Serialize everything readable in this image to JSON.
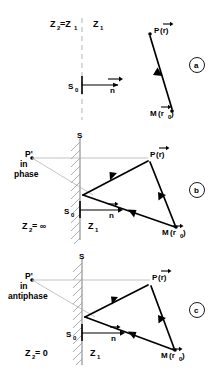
{
  "figure": {
    "type": "ray-reflection-diagram",
    "panel_count": 3
  },
  "symbols": {
    "point_P": "P",
    "point_M": "M",
    "point_P_image": "P'",
    "source_S0": "S",
    "source_S0_sub": "0",
    "surface_S": "S",
    "normal_vector": "n",
    "r_vector": "r",
    "r0_vector": "r",
    "r0_sub": "0",
    "paren_open": "(",
    "paren_close": ")",
    "equals": "=",
    "infinity": "∞",
    "zero": "0",
    "Z_letter": "Z",
    "sub_1": "1",
    "sub_2": "2"
  },
  "panels": [
    {
      "id": "a",
      "tag": "a",
      "impedance_left_label": "Z",
      "impedance_left_sub": "2",
      "impedance_left_eq": "=Z",
      "impedance_left_eq_sub": "1",
      "impedance_right_label": "Z",
      "impedance_right_sub": "1",
      "source_label": "S",
      "source_sub": "0",
      "normal_label": "n",
      "point_top_label": "P",
      "point_top_arg": "(r)",
      "point_bottom_label": "M",
      "point_bottom_arg": "(r",
      "point_bottom_sub": "0",
      "point_bottom_close": ")",
      "boundary_style": "dashed",
      "has_image_source": false,
      "phase_text": ""
    },
    {
      "id": "b",
      "tag": "b",
      "impedance_left_label": "Z",
      "impedance_left_sub": "2",
      "impedance_left_eq": "= ∞",
      "impedance_right_label": "Z",
      "impedance_right_sub": "1",
      "surface_label": "S",
      "source_label": "S",
      "source_sub": "0",
      "normal_label": "n",
      "point_top_label": "P",
      "point_top_arg": "(r)",
      "point_bottom_label": "M",
      "point_bottom_arg": "(r",
      "point_bottom_sub": "0",
      "point_bottom_close": ")",
      "image_label": "P'",
      "phase_line1": "in",
      "phase_line2": "phase",
      "boundary_style": "rigid-hatched",
      "has_image_source": true
    },
    {
      "id": "c",
      "tag": "c",
      "impedance_left_label": "Z",
      "impedance_left_sub": "2",
      "impedance_left_eq": "= 0",
      "impedance_right_label": "Z",
      "impedance_right_sub": "1",
      "surface_label": "S",
      "source_label": "S",
      "source_sub": "0",
      "normal_label": "n",
      "point_top_label": "P",
      "point_top_arg": "(r)",
      "point_bottom_label": "M",
      "point_bottom_arg": "(r",
      "point_bottom_sub": "0",
      "point_bottom_close": ")",
      "image_label": "P'",
      "phase_line1": "in",
      "phase_line2": "antiphase",
      "boundary_style": "soft-hatched",
      "has_image_source": true
    }
  ],
  "colors": {
    "ink": "#000000",
    "background": "#ffffff",
    "thin_ray": "#aaaaaa",
    "hatch": "#999999",
    "dashed_boundary": "#bbbbbb"
  }
}
